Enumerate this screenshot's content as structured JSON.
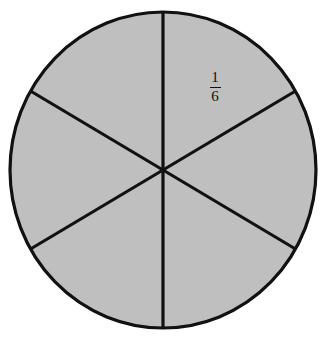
{
  "figure": {
    "kind": "fraction-circle",
    "background_color": "#ffffff",
    "fill_color": "#bfbfbf",
    "stroke_color": "#111111",
    "stroke_width": 3,
    "circle": {
      "center_x": 163,
      "center_y": 170,
      "radius_x": 153,
      "radius_y": 158
    },
    "sector_count": 6,
    "divider_angles_deg": [
      90,
      150,
      210,
      270,
      330,
      30
    ],
    "labels": [
      {
        "name": "sector-fraction-label",
        "numerator": "1",
        "denominator": "6",
        "text": "1/6",
        "x": 215,
        "y": 87
      }
    ]
  },
  "chart_data": {
    "type": "pie",
    "title": "",
    "categories": [
      "1",
      "2",
      "3",
      "4",
      "5",
      "6"
    ],
    "values": [
      1,
      1,
      1,
      1,
      1,
      1
    ],
    "fractions": [
      "1/6",
      "1/6",
      "1/6",
      "1/6",
      "1/6",
      "1/6"
    ],
    "labeled_slices": [
      "1/6"
    ],
    "slice_fill": "#bfbfbf",
    "slice_stroke": "#111111",
    "legend": "none",
    "grid": false,
    "xlabel": "",
    "ylabel": ""
  }
}
